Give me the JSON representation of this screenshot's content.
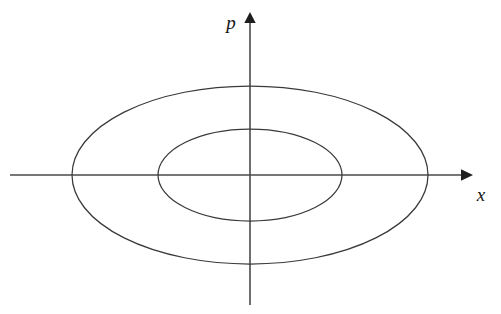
{
  "figure": {
    "background_color": "#ffffff",
    "curve_color": "#3a3a3a",
    "axis_color": "#4a4a4a",
    "label_color": "#141414"
  },
  "axes": {
    "horizontal": {
      "name": "x-axis",
      "label": "x",
      "label_position": "below-right-of-arrow",
      "start_px": [
        10,
        175
      ],
      "end_px": [
        472,
        175
      ],
      "arrow": "right"
    },
    "vertical": {
      "name": "p-axis",
      "label": "p",
      "label_position": "left-of-arrow",
      "start_px": [
        250,
        305
      ],
      "end_px": [
        250,
        13
      ],
      "arrow": "up"
    },
    "origin_px": [
      250,
      175
    ]
  },
  "chart_data": {
    "type": "line",
    "title": "",
    "xlabel": "x",
    "ylabel": "p",
    "grid": false,
    "legend": null,
    "annotations": [],
    "axis_style": "arrow-axes-through-origin",
    "origin": [
      0,
      0
    ],
    "xlim": [
      -240,
      222
    ],
    "ylim": [
      -130,
      162
    ],
    "series": [
      {
        "name": "outer-ellipse",
        "shape": "ellipse",
        "center": [
          0,
          0
        ],
        "semi_axis_x": 178,
        "semi_axis_y": 89,
        "vertices_px": {
          "left": [
            72,
            175
          ],
          "right": [
            428,
            175
          ],
          "top": [
            250,
            86
          ],
          "bottom": [
            250,
            264
          ]
        },
        "closed": true
      },
      {
        "name": "inner-ellipse",
        "shape": "ellipse",
        "center": [
          0,
          0
        ],
        "semi_axis_x": 92,
        "semi_axis_y": 46,
        "vertices_px": {
          "left": [
            158,
            175
          ],
          "right": [
            342,
            175
          ],
          "top": [
            250,
            129
          ],
          "bottom": [
            250,
            221
          ]
        },
        "closed": true
      }
    ]
  }
}
